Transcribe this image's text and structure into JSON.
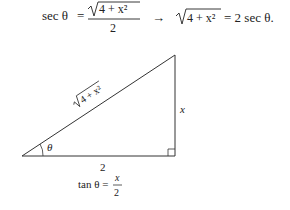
{
  "equation": {
    "lhs": "sec θ",
    "eq": "=",
    "frac_num_radicand": "4 + x²",
    "frac_den": "2",
    "arrow": "→",
    "rhs_radicand": "4 + x²",
    "rhs": "= 2 sec θ."
  },
  "triangle": {
    "hypotenuse_label": "4 + x²",
    "opposite_label": "x",
    "adjacent_label": "2",
    "angle_label": "θ"
  },
  "caption": {
    "lhs": "tan θ =",
    "num": "x",
    "den": "2"
  }
}
